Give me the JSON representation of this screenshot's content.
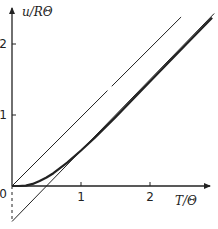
{
  "chart_data": {
    "type": "line",
    "title": "",
    "xlabel": "T/Θ",
    "ylabel": "u/RΘ",
    "xlim": [
      0,
      2.9
    ],
    "ylim": [
      -0.5,
      2.55
    ],
    "x_ticks": [
      {
        "value": 1,
        "label": "1"
      },
      {
        "value": 2,
        "label": "2"
      }
    ],
    "y_ticks": [
      {
        "value": 1,
        "label": "1"
      },
      {
        "value": 2,
        "label": "2"
      }
    ],
    "origin_label": "0",
    "grid": false,
    "legend": "none",
    "series": [
      {
        "name": "u (exact curve)",
        "style": "thick",
        "x": [
          0,
          0.1,
          0.2,
          0.3,
          0.4,
          0.5,
          0.6,
          0.8,
          1.0,
          1.2,
          1.5,
          2.0,
          2.5,
          2.9
        ],
        "y": [
          0,
          0.0,
          0.005,
          0.03,
          0.07,
          0.12,
          0.18,
          0.33,
          0.5,
          0.68,
          0.97,
          1.47,
          1.97,
          2.37
        ]
      },
      {
        "name": "high-temperature asymptote u = T/Θ − 1/2",
        "style": "thin",
        "x": [
          0,
          2.93
        ],
        "y": [
          -0.5,
          2.43
        ]
      },
      {
        "name": "classical line u = T/Θ",
        "style": "thin",
        "x": [
          0,
          2.45
        ],
        "y": [
          0,
          2.38
        ]
      },
      {
        "name": "intercept marker",
        "style": "dashed",
        "x": [
          0,
          0
        ],
        "y": [
          0,
          -0.5
        ]
      }
    ]
  }
}
